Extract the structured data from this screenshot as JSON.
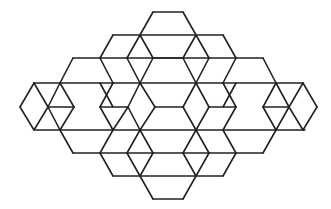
{
  "figure": {
    "width": 331,
    "height": 209,
    "stroke_color": "#222222",
    "background_color": "#ffffff",
    "stroke_width": 1.6,
    "segments": [
      [
        153,
        12,
        183,
        12
      ],
      [
        153,
        12,
        140,
        35
      ],
      [
        183,
        12,
        196,
        35
      ],
      [
        113,
        35,
        223,
        35
      ],
      [
        113,
        35,
        100,
        58
      ],
      [
        223,
        35,
        236,
        58
      ],
      [
        140,
        35,
        153,
        58
      ],
      [
        196,
        35,
        183,
        58
      ],
      [
        153,
        58,
        183,
        58
      ],
      [
        73,
        58,
        263,
        58
      ],
      [
        73,
        58,
        60,
        83
      ],
      [
        263,
        58,
        276,
        83
      ],
      [
        100,
        58,
        113,
        83
      ],
      [
        236,
        58,
        223,
        83
      ],
      [
        140,
        35,
        127,
        58
      ],
      [
        196,
        35,
        209,
        58
      ],
      [
        127,
        58,
        140,
        83
      ],
      [
        209,
        58,
        196,
        83
      ],
      [
        153,
        58,
        140,
        83
      ],
      [
        183,
        58,
        196,
        83
      ],
      [
        34,
        83,
        303,
        83
      ],
      [
        34,
        83,
        20,
        107
      ],
      [
        34,
        83,
        48,
        107
      ],
      [
        303,
        83,
        289,
        107
      ],
      [
        303,
        83,
        317,
        107
      ],
      [
        60,
        83,
        48,
        107
      ],
      [
        60,
        83,
        74,
        107
      ],
      [
        100,
        83,
        113,
        107
      ],
      [
        113,
        83,
        100,
        107
      ],
      [
        140,
        83,
        128,
        107
      ],
      [
        140,
        83,
        155,
        107
      ],
      [
        196,
        83,
        183,
        107
      ],
      [
        196,
        83,
        209,
        107
      ],
      [
        223,
        83,
        236,
        107
      ],
      [
        236,
        83,
        223,
        107
      ],
      [
        276,
        83,
        289,
        107
      ],
      [
        276,
        83,
        263,
        107
      ],
      [
        48,
        107,
        74,
        107
      ],
      [
        100,
        107,
        128,
        107
      ],
      [
        155,
        107,
        183,
        107
      ],
      [
        209,
        107,
        236,
        107
      ],
      [
        263,
        107,
        289,
        107
      ],
      [
        20,
        107,
        34,
        130
      ],
      [
        48,
        107,
        34,
        130
      ],
      [
        317,
        107,
        303,
        130
      ],
      [
        289,
        107,
        303,
        130
      ],
      [
        74,
        107,
        60,
        130
      ],
      [
        48,
        107,
        60,
        130
      ],
      [
        100,
        107,
        113,
        130
      ],
      [
        128,
        107,
        113,
        130
      ],
      [
        128,
        107,
        140,
        130
      ],
      [
        155,
        107,
        140,
        130
      ],
      [
        183,
        107,
        196,
        130
      ],
      [
        209,
        107,
        196,
        130
      ],
      [
        236,
        107,
        223,
        130
      ],
      [
        263,
        107,
        276,
        130
      ],
      [
        289,
        107,
        276,
        130
      ],
      [
        35,
        130,
        305,
        130
      ],
      [
        60,
        130,
        73,
        153
      ],
      [
        276,
        130,
        263,
        153
      ],
      [
        113,
        130,
        100,
        153
      ],
      [
        223,
        130,
        236,
        153
      ],
      [
        140,
        130,
        153,
        153
      ],
      [
        196,
        130,
        183,
        153
      ],
      [
        73,
        153,
        263,
        153
      ],
      [
        100,
        153,
        113,
        176
      ],
      [
        236,
        153,
        223,
        176
      ],
      [
        140,
        130,
        127,
        153
      ],
      [
        127,
        153,
        140,
        176
      ],
      [
        196,
        130,
        209,
        153
      ],
      [
        209,
        153,
        196,
        176
      ],
      [
        113,
        176,
        223,
        176
      ],
      [
        140,
        176,
        153,
        199
      ],
      [
        196,
        176,
        183,
        199
      ],
      [
        153,
        153,
        140,
        176
      ],
      [
        183,
        153,
        196,
        176
      ],
      [
        153,
        199,
        183,
        199
      ]
    ]
  }
}
